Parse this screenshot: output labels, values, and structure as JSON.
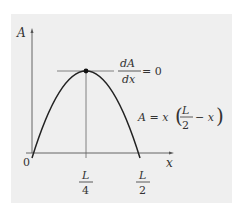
{
  "figure": {
    "type": "parabola-plot",
    "y_axis_label": "A",
    "x_axis_label": "x",
    "origin_label": "0",
    "x_ticks": [
      {
        "num": "L",
        "den": "4"
      },
      {
        "num": "L",
        "den": "2"
      }
    ],
    "derivative_annotation": {
      "num": "dA",
      "den": "dx",
      "rhs": "= 0"
    },
    "equation": {
      "lhs": "A = x",
      "frac_num": "L",
      "frac_den": "2",
      "tail": "− x"
    },
    "colors": {
      "background": "#efefef",
      "curve": "#222222",
      "axes": "#555555",
      "text": "#333333"
    }
  }
}
